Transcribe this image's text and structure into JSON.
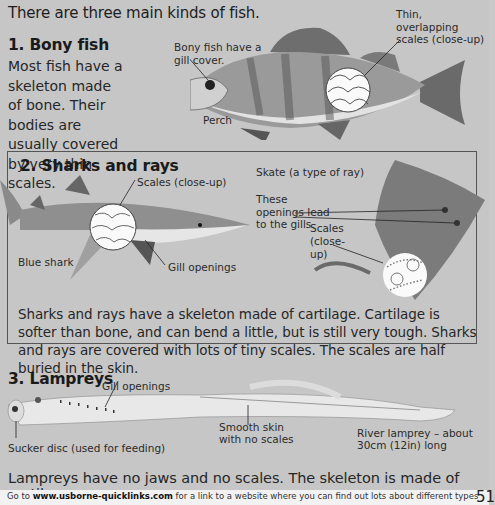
{
  "page": {
    "intro": "There are three main kinds of fish.",
    "sections": [
      {
        "heading": "1. Bony fish",
        "body": "Most fish have a skeleton made of bone. Their bodies are usually covered by very thin scales.",
        "illustration": "perch-illustration",
        "labels": {
          "gill_cover": "Bony fish have a gill cover.",
          "scales": "Thin, overlapping scales (close-up)",
          "name": "Perch"
        }
      },
      {
        "heading": "2. Sharks and rays",
        "body": "Sharks and rays have a skeleton made of cartilage. Cartilage is softer than bone, and can bend a little, but is still very tough. Sharks and rays are covered with lots of tiny scales. The scales are half buried in the skin.",
        "illustrations": [
          "blue-shark-illustration",
          "skate-illustration"
        ],
        "labels": {
          "shark_scales": "Scales (close-up)",
          "shark_name": "Blue shark",
          "gill_openings": "Gill openings",
          "skate_name": "Skate (a type of ray)",
          "openings": "These openings lead to the gills.",
          "skate_scales_1": "Scales",
          "skate_scales_2": "(close-",
          "skate_scales_3": "up)"
        }
      },
      {
        "heading": "3. Lampreys",
        "body": "Lampreys have no jaws and no scales. The skeleton is made of cartilage.",
        "illustration": "river-lamprey-illustration",
        "labels": {
          "gill_openings": "Gill openings",
          "smooth_skin_1": "Smooth skin",
          "smooth_skin_2": "with no scales",
          "lamprey_1": "River lamprey – about",
          "lamprey_2": "30cm (12in) long",
          "sucker": "Sucker disc (used for feeding)"
        }
      }
    ]
  },
  "footer": {
    "prefix": "Go to ",
    "link": "www.usborne-quicklinks.com",
    "suffix": " for a link to a website where you can find out lots about different types",
    "page_number": "51"
  }
}
